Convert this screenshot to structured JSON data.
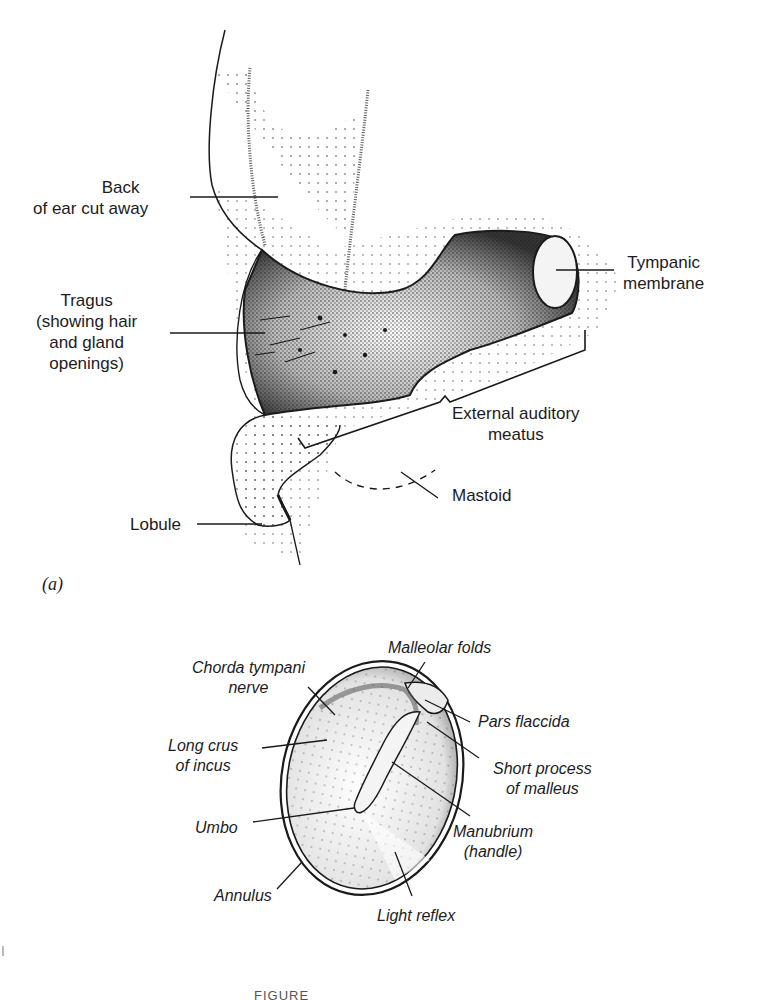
{
  "figure": {
    "panel_a": {
      "tag": "(a)",
      "labels": {
        "back_of_ear": [
          "Back",
          "of ear cut away"
        ],
        "tragus": [
          "Tragus",
          "(showing hair",
          "and gland",
          "openings)"
        ],
        "tympanic_membrane": [
          "Tympanic",
          "membrane"
        ],
        "external_auditory_meatus": [
          "External auditory",
          "meatus"
        ],
        "mastoid": "Mastoid",
        "lobule": "Lobule"
      }
    },
    "panel_b": {
      "labels": {
        "malleolar_folds": "Malleolar folds",
        "chorda_tympani": [
          "Chorda tympani",
          "nerve"
        ],
        "pars_flaccida": "Pars flaccida",
        "long_crus": [
          "Long crus",
          "of incus"
        ],
        "short_process": [
          "Short process",
          "of malleus"
        ],
        "umbo": "Umbo",
        "manubrium": [
          "Manubrium",
          "(handle)"
        ],
        "annulus": "Annulus",
        "light_reflex": "Light reflex"
      }
    },
    "caption": "FIGURE"
  },
  "colors": {
    "ink": "#1a1a1a",
    "stipple": "#2a2a2a",
    "paper": "#ffffff"
  }
}
